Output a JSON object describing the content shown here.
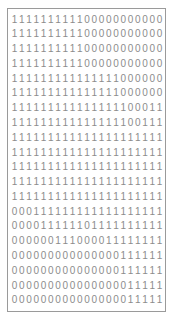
{
  "panel": {
    "title": "binary-matrix",
    "border_color": "#9a9a9a",
    "background_color": "#ffffff",
    "digit_color": "#8c8c8c",
    "rows": 20,
    "columns": 21
  },
  "matrix": {
    "rows": [
      "111111111100000000000",
      "111111111100000000000",
      "111111111100000000000",
      "111111111100000000000",
      "111111111111111000000",
      "111111111111111000000",
      "111111111111111100011",
      "111111111111111100111",
      "111111111111111111111",
      "111111111111111111111",
      "111111111111111111111",
      "111111111111111111111",
      "111111111111111111111",
      "000111111111111111111",
      "000011111101111111111",
      "000000111000011111111",
      "000000000000000111111",
      "000000000000000111111",
      "000000000000000011111",
      "000000000000000011111"
    ]
  }
}
